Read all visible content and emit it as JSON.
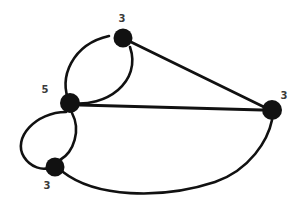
{
  "figure": {
    "type": "graph-diagram",
    "background_color": "#ffffff",
    "stroke_color": "#111111",
    "label_color": "#3a3a3a",
    "width": 295,
    "height": 211
  },
  "chart_data": {
    "type": "diagram",
    "title": "",
    "nodes": [
      {
        "id": "top",
        "label": "3",
        "x": 123,
        "y": 38,
        "r": 9.5,
        "label_x": 122,
        "label_y": 19,
        "degree": 3
      },
      {
        "id": "left",
        "label": "5",
        "x": 70,
        "y": 103,
        "r": 10,
        "label_x": 45,
        "label_y": 90,
        "degree": 5
      },
      {
        "id": "right",
        "label": "3",
        "x": 272,
        "y": 110,
        "r": 10,
        "label_x": 284,
        "label_y": 96,
        "degree": 3
      },
      {
        "id": "bottom",
        "label": "3",
        "x": 55,
        "y": 167,
        "r": 9.5,
        "label_x": 47,
        "label_y": 186,
        "degree": 3
      }
    ],
    "edges": [
      {
        "from": "left",
        "to": "top",
        "style": "curved",
        "side": "outer",
        "path": "M 70 103 C 57 78 73 44 109 36"
      },
      {
        "from": "left",
        "to": "top",
        "style": "curved",
        "side": "inner",
        "path": "M 70 103 C 106 108 142 82 130 47"
      },
      {
        "from": "left",
        "to": "bottom",
        "style": "curved",
        "side": "outer",
        "path": "M 66 112 C 36 112 12 138 24 157 C 31 168 43 170 48 168"
      },
      {
        "from": "left",
        "to": "bottom",
        "style": "curved",
        "side": "inner",
        "path": "M 72 113 C 81 130 74 152 60 160"
      },
      {
        "from": "top",
        "to": "right",
        "style": "straight",
        "path": "M 131 42 L 264 107"
      },
      {
        "from": "left",
        "to": "right",
        "style": "straight",
        "path": "M 80 105 L 262 110"
      },
      {
        "from": "bottom",
        "to": "right",
        "style": "curved",
        "side": "lower",
        "path": "M 63 172 C 95 197 160 200 215 182 C 250 170 268 140 272 120"
      }
    ]
  }
}
